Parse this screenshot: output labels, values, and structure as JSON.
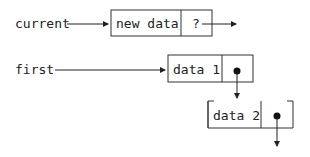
{
  "diagram": {
    "type": "linked-list-insertion",
    "pointers": [
      {
        "label": "current",
        "target": "node-new"
      },
      {
        "label": "first",
        "target": "node-1"
      }
    ],
    "nodes": [
      {
        "id": "node-new",
        "data": "new data",
        "link": "?"
      },
      {
        "id": "node-1",
        "data": "data 1",
        "link": "•"
      },
      {
        "id": "node-2",
        "data": "data 2",
        "link": "•"
      }
    ]
  }
}
